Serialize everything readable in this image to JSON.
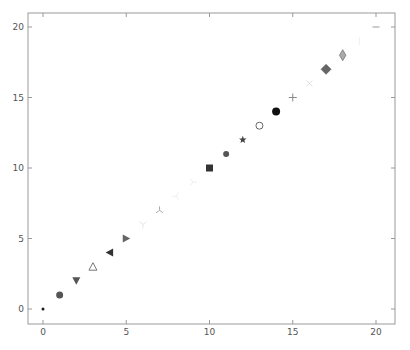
{
  "chart_data": {
    "type": "scatter",
    "title": "",
    "xlabel": "",
    "ylabel": "",
    "xlim": [
      -1,
      21
    ],
    "ylim": [
      -1,
      21
    ],
    "grid": false,
    "legend": null,
    "x_ticks": [
      "0",
      "5",
      "10",
      "15",
      "20"
    ],
    "y_ticks": [
      "0",
      "5",
      "10",
      "15",
      "20"
    ],
    "points": [
      {
        "x": 0,
        "y": 0,
        "marker": "point",
        "color": "#1a1a1a"
      },
      {
        "x": 1,
        "y": 1,
        "marker": "circle",
        "color": "#555555"
      },
      {
        "x": 2,
        "y": 2,
        "marker": "triangle_down",
        "color": "#555555"
      },
      {
        "x": 3,
        "y": 3,
        "marker": "triangle_up_open",
        "color": "#777777"
      },
      {
        "x": 4,
        "y": 4,
        "marker": "triangle_left",
        "color": "#333333"
      },
      {
        "x": 5,
        "y": 5,
        "marker": "triangle_right",
        "color": "#666666"
      },
      {
        "x": 6,
        "y": 6,
        "marker": "tri_down",
        "color": "#e6e6e6"
      },
      {
        "x": 7,
        "y": 7,
        "marker": "tri_up",
        "color": "#aaaaaa"
      },
      {
        "x": 8,
        "y": 8,
        "marker": "tri_left",
        "color": "#eeeeee"
      },
      {
        "x": 9,
        "y": 9,
        "marker": "tri_right",
        "color": "#eeeeee"
      },
      {
        "x": 10,
        "y": 10,
        "marker": "square",
        "color": "#333333"
      },
      {
        "x": 11,
        "y": 11,
        "marker": "hexagon",
        "color": "#555555"
      },
      {
        "x": 12,
        "y": 12,
        "marker": "star",
        "color": "#444444"
      },
      {
        "x": 13,
        "y": 13,
        "marker": "circle_open",
        "color": "#666666"
      },
      {
        "x": 14,
        "y": 14,
        "marker": "octagon",
        "color": "#111111"
      },
      {
        "x": 15,
        "y": 15,
        "marker": "plus",
        "color": "#888888"
      },
      {
        "x": 16,
        "y": 16,
        "marker": "x",
        "color": "#e0e0e0"
      },
      {
        "x": 17,
        "y": 17,
        "marker": "diamond",
        "color": "#666666"
      },
      {
        "x": 18,
        "y": 18,
        "marker": "thin_diamond",
        "color": "#aaaaaa"
      },
      {
        "x": 19,
        "y": 19,
        "marker": "vline",
        "color": "#f0f0f0"
      },
      {
        "x": 20,
        "y": 20,
        "marker": "hline",
        "color": "#999999"
      }
    ]
  }
}
